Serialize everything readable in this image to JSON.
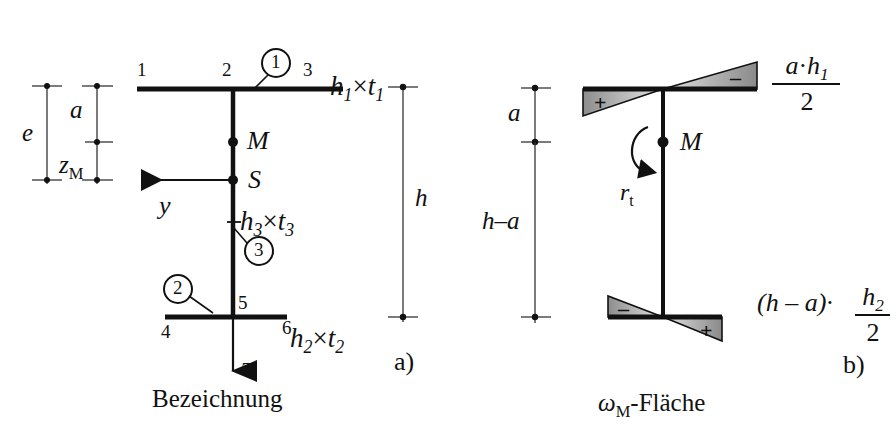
{
  "figure": {
    "panel_a": {
      "id": "a)",
      "caption": "Bezeichnung",
      "node_labels": [
        "1",
        "2",
        "3",
        "4",
        "5",
        "6"
      ],
      "part_markers": [
        "1",
        "2",
        "3"
      ],
      "dimensions": {
        "e": "e",
        "a": "a",
        "zM": "z",
        "zM_sub": "M",
        "h": "h"
      },
      "points": {
        "M": "M",
        "S": "S"
      },
      "axes": {
        "y": "y",
        "z": "z"
      },
      "section_labels": {
        "top_flange": "h",
        "top_flange_sub1": "1",
        "top_flange_times": "×",
        "top_flange_t": "t",
        "top_flange_sub2": "1",
        "web": "h",
        "web_sub1": "3",
        "web_t": "t",
        "web_sub2": "3",
        "bottom_flange": "h",
        "bottom_flange_sub1": "2",
        "bottom_flange_t": "t",
        "bottom_flange_sub2": "2"
      }
    },
    "panel_b": {
      "id": "b)",
      "caption_omega": "ω",
      "caption_omega_sub": "M",
      "caption_rest": "-Fläche",
      "dimensions": {
        "a": "a",
        "h_minus_a": "h–a"
      },
      "points": {
        "M": "M"
      },
      "rotation": {
        "symbol": "r",
        "symbol_sub": "t"
      },
      "signs": {
        "top_left": "+",
        "top_right": "–",
        "bottom_left": "–",
        "bottom_right": "+"
      },
      "formulas": {
        "top_num_a": "a",
        "top_num_dot": "·",
        "top_num_h": "h",
        "top_num_h_sub": "1",
        "top_den": "2",
        "bottom_prefix": "(h – a)·",
        "bottom_num_h": "h",
        "bottom_num_h_sub": "2",
        "bottom_den": "2"
      }
    },
    "colors": {
      "ink": "#111111",
      "shade_dark": "#6e6e6e",
      "shade_light": "#d8d8d8"
    }
  }
}
